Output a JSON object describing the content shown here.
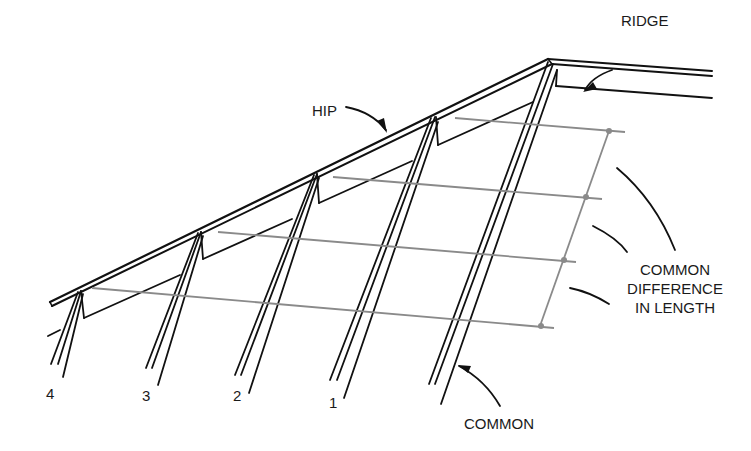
{
  "diagram": {
    "labels": {
      "ridge": "RIDGE",
      "hip": "HIP",
      "common": "COMMON",
      "common_difference": [
        "COMMON",
        "DIFFERENCE",
        "IN LENGTH"
      ]
    },
    "rafter_numbers": [
      "4",
      "3",
      "2",
      "1"
    ],
    "colors": {
      "line": "#111111",
      "dimension": "#8a8a8a",
      "background": "#ffffff"
    }
  }
}
